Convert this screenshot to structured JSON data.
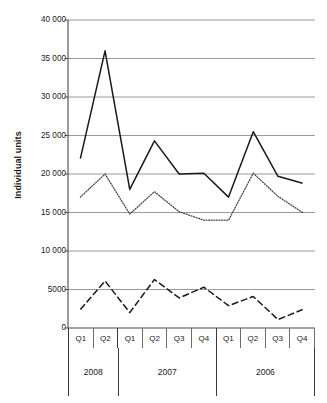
{
  "chart_data": {
    "type": "line",
    "title": "",
    "xlabel": "",
    "ylabel": "Individual units",
    "ylim": [
      0,
      40000
    ],
    "grid": true,
    "legend": "none",
    "y_ticks": [
      {
        "value": 40000,
        "label": "40 000"
      },
      {
        "value": 35000,
        "label": "35 000"
      },
      {
        "value": 30000,
        "label": "30 000"
      },
      {
        "value": 25000,
        "label": "25 000"
      },
      {
        "value": 20000,
        "label": "20 000"
      },
      {
        "value": 15000,
        "label": "15 000"
      },
      {
        "value": 10000,
        "label": "10 000"
      },
      {
        "value": 5000,
        "label": "5000"
      },
      {
        "value": 0,
        "label": "0"
      }
    ],
    "categories": [
      "Q1",
      "Q2",
      "Q1",
      "Q2",
      "Q3",
      "Q4",
      "Q1",
      "Q2",
      "Q3",
      "Q4"
    ],
    "groups": [
      {
        "label": "2008",
        "span": 2
      },
      {
        "label": "2007",
        "span": 4
      },
      {
        "label": "2006",
        "span": 4
      }
    ],
    "series": [
      {
        "name": "series-solid",
        "style": "solid",
        "color": "#1a1a1a",
        "values": [
          22000,
          36000,
          18000,
          24300,
          20000,
          20100,
          17000,
          25500,
          19700,
          18800
        ]
      },
      {
        "name": "series-dotted",
        "style": "dotted",
        "color": "#4a4a4a",
        "values": [
          17000,
          20000,
          14800,
          17700,
          15100,
          14000,
          14000,
          20100,
          17100,
          15000
        ]
      },
      {
        "name": "series-dashed",
        "style": "dashed",
        "color": "#1a1a1a",
        "values": [
          2400,
          6100,
          2000,
          6300,
          3900,
          5300,
          2900,
          4100,
          1100,
          2400
        ]
      }
    ]
  }
}
